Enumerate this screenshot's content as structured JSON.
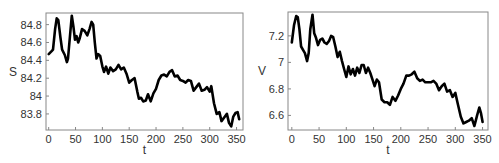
{
  "chart_data": [
    {
      "type": "line",
      "title": "",
      "xlabel": "t",
      "ylabel": "S",
      "xlim": [
        -5,
        362
      ],
      "ylim": [
        83.62,
        84.93
      ],
      "xticks": [
        0,
        50,
        100,
        150,
        200,
        250,
        300,
        350
      ],
      "yticks": [
        83.8,
        84,
        84.2,
        84.4,
        84.6,
        84.8
      ],
      "ytick_labels": [
        "83.8",
        "84",
        "84.2",
        "84.4",
        "84.6",
        "84.8"
      ],
      "grid": false,
      "frame": {
        "x0": 46,
        "y0": 13,
        "x1": 243,
        "y1": 130
      },
      "series": [
        {
          "name": "S",
          "x": [
            0,
            5,
            8,
            12,
            15,
            18,
            22,
            25,
            30,
            34,
            36,
            40,
            43,
            46,
            49,
            52,
            55,
            58,
            62,
            67,
            72,
            76,
            80,
            83,
            86,
            89,
            92,
            96,
            100,
            103,
            107,
            111,
            115,
            120,
            125,
            130,
            135,
            140,
            145,
            150,
            155,
            160,
            165,
            168,
            172,
            176,
            181,
            185,
            190,
            195,
            200,
            205,
            210,
            215,
            220,
            225,
            230,
            235,
            240,
            245,
            250,
            255,
            260,
            265,
            270,
            275,
            280,
            285,
            290,
            295,
            300,
            303,
            308,
            313,
            318,
            322,
            327,
            332,
            336,
            340,
            344,
            348,
            352,
            355
          ],
          "values": [
            84.47,
            84.5,
            84.52,
            84.75,
            84.87,
            84.85,
            84.65,
            84.52,
            84.46,
            84.38,
            84.42,
            84.7,
            84.9,
            84.78,
            84.63,
            84.67,
            84.6,
            84.65,
            84.75,
            84.73,
            84.68,
            84.75,
            84.83,
            84.8,
            84.6,
            84.42,
            84.47,
            84.45,
            84.33,
            84.27,
            84.33,
            84.25,
            84.32,
            84.28,
            84.3,
            84.35,
            84.3,
            84.32,
            84.25,
            84.15,
            84.18,
            84.2,
            84.05,
            83.97,
            83.98,
            83.94,
            83.95,
            84.02,
            83.94,
            84.03,
            84.08,
            84.18,
            84.23,
            84.24,
            84.22,
            84.27,
            84.29,
            84.22,
            84.23,
            84.18,
            84.17,
            84.15,
            84.18,
            84.17,
            84.06,
            84.1,
            84.14,
            84.06,
            84.07,
            84.1,
            84.05,
            84.11,
            83.92,
            83.8,
            83.82,
            83.72,
            83.76,
            83.8,
            83.7,
            83.66,
            83.77,
            83.81,
            83.82,
            83.74
          ]
        }
      ]
    },
    {
      "type": "line",
      "title": "",
      "xlabel": "t",
      "ylabel": "V",
      "xlim": [
        -7,
        360
      ],
      "ylim": [
        6.49,
        7.38
      ],
      "xticks": [
        0,
        50,
        100,
        150,
        200,
        250,
        300,
        350
      ],
      "yticks": [
        6.6,
        6.8,
        7,
        7.2
      ],
      "ytick_labels": [
        "6.6",
        "6.8",
        "7",
        "7.2"
      ],
      "grid": false,
      "frame": {
        "x0": 288,
        "y0": 12,
        "x1": 488,
        "y1": 130
      },
      "series": [
        {
          "name": "V",
          "x": [
            0,
            4,
            8,
            11,
            14,
            17,
            21,
            24,
            28,
            31,
            34,
            38,
            41,
            44,
            48,
            52,
            56,
            60,
            64,
            68,
            72,
            76,
            80,
            84,
            88,
            92,
            96,
            100,
            104,
            108,
            112,
            116,
            120,
            124,
            128,
            132,
            136,
            140,
            144,
            148,
            152,
            156,
            160,
            165,
            170,
            175,
            180,
            185,
            190,
            195,
            200,
            205,
            210,
            215,
            220,
            225,
            230,
            235,
            240,
            245,
            250,
            255,
            260,
            265,
            270,
            275,
            280,
            285,
            290,
            295,
            300,
            305,
            310,
            315,
            320,
            325,
            330,
            335,
            340,
            344,
            347,
            350
          ],
          "values": [
            7.15,
            7.28,
            7.35,
            7.34,
            7.25,
            7.12,
            7.09,
            7.07,
            7.01,
            7.07,
            7.25,
            7.36,
            7.22,
            7.19,
            7.13,
            7.17,
            7.18,
            7.15,
            7.14,
            7.16,
            7.2,
            7.19,
            7.12,
            7.04,
            7.08,
            7.01,
            6.95,
            6.89,
            6.97,
            6.91,
            6.95,
            6.9,
            6.96,
            6.92,
            6.98,
            6.98,
            6.92,
            6.96,
            6.92,
            6.87,
            6.82,
            6.87,
            6.85,
            6.72,
            6.7,
            6.7,
            6.68,
            6.74,
            6.71,
            6.75,
            6.8,
            6.84,
            6.9,
            6.9,
            6.91,
            6.93,
            6.88,
            6.86,
            6.87,
            6.85,
            6.85,
            6.85,
            6.86,
            6.84,
            6.79,
            6.82,
            6.84,
            6.78,
            6.79,
            6.74,
            6.77,
            6.68,
            6.59,
            6.54,
            6.55,
            6.56,
            6.58,
            6.52,
            6.6,
            6.66,
            6.62,
            6.55,
            6.58
          ]
        }
      ]
    }
  ]
}
